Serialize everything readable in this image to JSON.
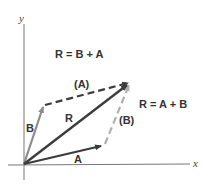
{
  "axes": {
    "x_label": "x",
    "y_label": "y"
  },
  "equations": {
    "top": "R = B + A",
    "right": "R = A + B"
  },
  "vectors": {
    "A": "A",
    "B": "B",
    "R": "R",
    "A_shifted": "(A)",
    "B_shifted": "(B)"
  },
  "colors": {
    "dark": "#3c3c3c",
    "mid": "#8c8c8c",
    "light": "#b0b0b0",
    "axis": "#777777"
  }
}
